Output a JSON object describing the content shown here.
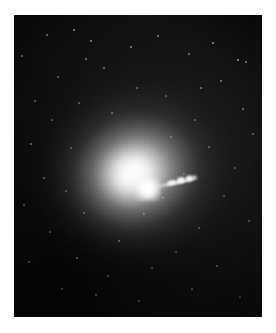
{
  "image": {
    "subject_name": "M87",
    "subject_type": "elliptical galaxy",
    "caption": "",
    "width_px": 276,
    "height_px": 333,
    "border_color": "#ffffff",
    "sky_color": "#060606",
    "glow_color": "#ffffff",
    "plate": {
      "left": 14,
      "top": 15,
      "width": 248,
      "height": 302
    }
  },
  "features": {
    "nucleus": {
      "label": "galactic nucleus",
      "x": 134,
      "y": 174,
      "peak_color": "#ffffff"
    },
    "halo": {
      "label": "diffuse stellar halo",
      "center_x": 135,
      "center_y": 173,
      "position_angle_deg": -18
    },
    "jet": {
      "label": "relativistic jet",
      "start_x": 148,
      "start_y": 174,
      "end_x": 184,
      "end_y": 166,
      "position_angle_deg": -12,
      "knot_count": 4
    }
  },
  "point_sources": [
    {
      "x": 22,
      "y": 56,
      "r": 0.8,
      "o": 0.42
    },
    {
      "x": 35,
      "y": 101,
      "r": 0.7,
      "o": 0.34
    },
    {
      "x": 31,
      "y": 144,
      "r": 0.8,
      "o": 0.38
    },
    {
      "x": 24,
      "y": 205,
      "r": 0.7,
      "o": 0.3
    },
    {
      "x": 29,
      "y": 262,
      "r": 0.7,
      "o": 0.26
    },
    {
      "x": 47,
      "y": 35,
      "r": 0.9,
      "o": 0.46
    },
    {
      "x": 58,
      "y": 77,
      "r": 0.7,
      "o": 0.33
    },
    {
      "x": 52,
      "y": 120,
      "r": 0.7,
      "o": 0.3
    },
    {
      "x": 44,
      "y": 178,
      "r": 0.8,
      "o": 0.34
    },
    {
      "x": 50,
      "y": 232,
      "r": 0.7,
      "o": 0.28
    },
    {
      "x": 62,
      "y": 289,
      "r": 0.7,
      "o": 0.26
    },
    {
      "x": 74,
      "y": 30,
      "r": 1.0,
      "o": 0.55
    },
    {
      "x": 86,
      "y": 59,
      "r": 0.8,
      "o": 0.4
    },
    {
      "x": 91,
      "y": 41,
      "r": 0.9,
      "o": 0.5
    },
    {
      "x": 79,
      "y": 103,
      "r": 0.7,
      "o": 0.32
    },
    {
      "x": 71,
      "y": 148,
      "r": 0.7,
      "o": 0.3
    },
    {
      "x": 84,
      "y": 213,
      "r": 0.8,
      "o": 0.32
    },
    {
      "x": 77,
      "y": 258,
      "r": 0.7,
      "o": 0.28
    },
    {
      "x": 96,
      "y": 295,
      "r": 0.7,
      "o": 0.26
    },
    {
      "x": 104,
      "y": 68,
      "r": 0.8,
      "o": 0.42
    },
    {
      "x": 112,
      "y": 113,
      "r": 0.7,
      "o": 0.36
    },
    {
      "x": 119,
      "y": 241,
      "r": 0.8,
      "o": 0.34
    },
    {
      "x": 108,
      "y": 276,
      "r": 0.7,
      "o": 0.26
    },
    {
      "x": 131,
      "y": 47,
      "r": 0.9,
      "o": 0.48
    },
    {
      "x": 137,
      "y": 88,
      "r": 0.7,
      "o": 0.36
    },
    {
      "x": 144,
      "y": 214,
      "r": 0.8,
      "o": 0.38
    },
    {
      "x": 139,
      "y": 301,
      "r": 0.7,
      "o": 0.24
    },
    {
      "x": 158,
      "y": 36,
      "r": 0.9,
      "o": 0.46
    },
    {
      "x": 166,
      "y": 96,
      "r": 0.7,
      "o": 0.34
    },
    {
      "x": 171,
      "y": 137,
      "r": 0.8,
      "o": 0.38
    },
    {
      "x": 163,
      "y": 198,
      "r": 0.8,
      "o": 0.34
    },
    {
      "x": 176,
      "y": 252,
      "r": 0.7,
      "o": 0.26
    },
    {
      "x": 189,
      "y": 54,
      "r": 0.9,
      "o": 0.44
    },
    {
      "x": 195,
      "y": 120,
      "r": 0.8,
      "o": 0.36
    },
    {
      "x": 184,
      "y": 174,
      "r": 0.8,
      "o": 0.34
    },
    {
      "x": 199,
      "y": 228,
      "r": 0.7,
      "o": 0.28
    },
    {
      "x": 192,
      "y": 289,
      "r": 0.7,
      "o": 0.24
    },
    {
      "x": 213,
      "y": 43,
      "r": 1.0,
      "o": 0.56
    },
    {
      "x": 221,
      "y": 81,
      "r": 0.8,
      "o": 0.4
    },
    {
      "x": 209,
      "y": 147,
      "r": 0.7,
      "o": 0.32
    },
    {
      "x": 224,
      "y": 196,
      "r": 0.8,
      "o": 0.3
    },
    {
      "x": 217,
      "y": 266,
      "r": 0.7,
      "o": 0.26
    },
    {
      "x": 238,
      "y": 60,
      "r": 1.0,
      "o": 0.6
    },
    {
      "x": 246,
      "y": 62,
      "r": 0.9,
      "o": 0.5
    },
    {
      "x": 243,
      "y": 109,
      "r": 0.8,
      "o": 0.38
    },
    {
      "x": 235,
      "y": 168,
      "r": 0.7,
      "o": 0.3
    },
    {
      "x": 249,
      "y": 221,
      "r": 0.7,
      "o": 0.28
    },
    {
      "x": 240,
      "y": 297,
      "r": 0.7,
      "o": 0.22
    },
    {
      "x": 253,
      "y": 134,
      "r": 0.8,
      "o": 0.34
    },
    {
      "x": 201,
      "y": 88,
      "r": 0.8,
      "o": 0.4
    },
    {
      "x": 66,
      "y": 191,
      "r": 0.7,
      "o": 0.28
    },
    {
      "x": 152,
      "y": 268,
      "r": 0.7,
      "o": 0.24
    }
  ]
}
